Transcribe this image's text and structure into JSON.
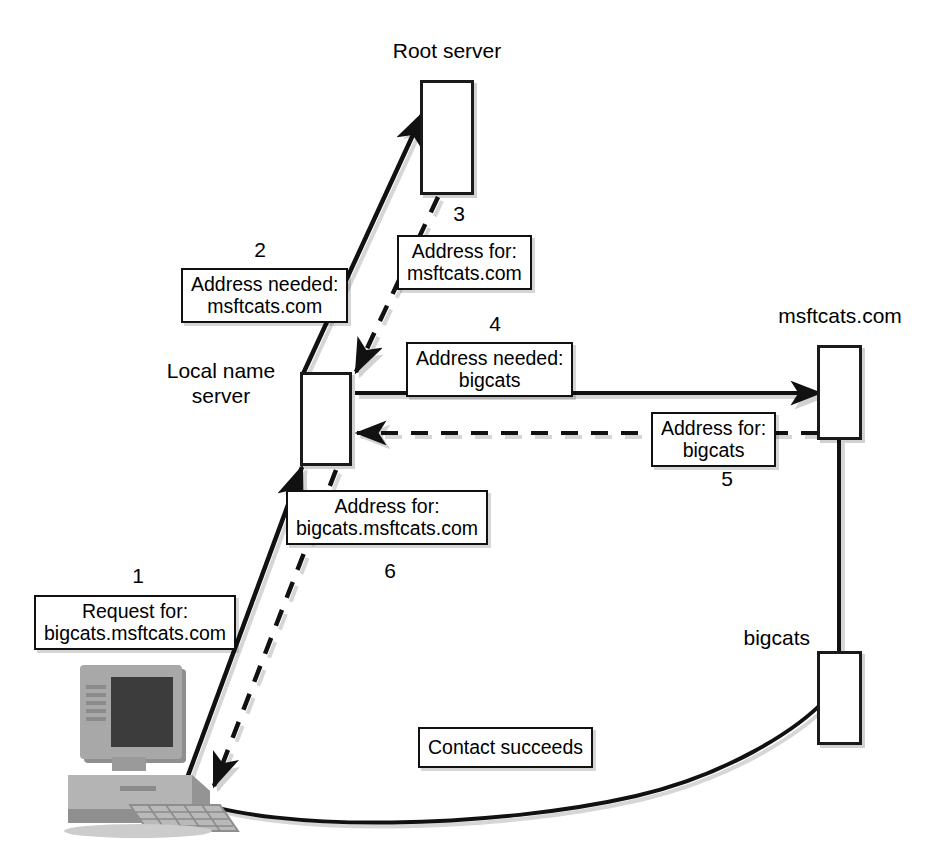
{
  "diagram": {
    "type": "network-sequence-diagram",
    "nodes": [
      {
        "id": "root-server",
        "label": "Root server",
        "label_position": "above"
      },
      {
        "id": "local-name-server",
        "label": "Local name\nserver",
        "label_position": "left"
      },
      {
        "id": "msftcats-server",
        "label": "msftcats.com",
        "label_position": "above"
      },
      {
        "id": "bigcats-host",
        "label": "bigcats",
        "label_position": "left"
      },
      {
        "id": "client-computer",
        "label": "client computer",
        "label_position": "none"
      }
    ],
    "messages": [
      {
        "step": "1",
        "text": "Request for:\nbigcats.msftcats.com",
        "from": "client-computer",
        "to": "local-name-server",
        "style": "solid"
      },
      {
        "step": "2",
        "text": "Address needed:\nmsftcats.com",
        "from": "local-name-server",
        "to": "root-server",
        "style": "solid"
      },
      {
        "step": "3",
        "text": "Address for:\nmsftcats.com",
        "from": "root-server",
        "to": "local-name-server",
        "style": "dashed"
      },
      {
        "step": "4",
        "text": "Address needed:\nbigcats",
        "from": "local-name-server",
        "to": "msftcats-server",
        "style": "solid"
      },
      {
        "step": "5",
        "text": "Address for:\nbigcats",
        "from": "msftcats-server",
        "to": "local-name-server",
        "style": "dashed"
      },
      {
        "step": "6",
        "text": "Address for:\nbigcats.msftcats.com",
        "from": "local-name-server",
        "to": "client-computer",
        "style": "dashed"
      },
      {
        "step": "",
        "text": "Contact succeeds",
        "from": "client-computer",
        "to": "bigcats-host",
        "style": "curve"
      }
    ],
    "colors": {
      "line": "#111111",
      "box_border": "#1a1a1a",
      "background": "#ffffff",
      "shadow": "#cfcfcf",
      "computer_body": "#9a9a9a",
      "computer_screen": "#3a3a3a"
    }
  }
}
